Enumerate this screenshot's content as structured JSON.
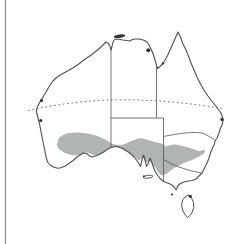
{
  "figure": {
    "type": "species-distribution-map",
    "region": "Australia",
    "features": {
      "mainland": "Australia mainland coastline with state borders",
      "shading": "grey distribution range across southern Australia",
      "dotted_line": "Tropic of Capricorn",
      "islands": [
        "Melville Island",
        "Groote Eylandt",
        "Mornington Island",
        "Fraser Island dot",
        "Shark Bay dot",
        "west-coast dot",
        "Kangaroo Island",
        "Bass Strait islet",
        "Tasmania"
      ]
    }
  },
  "colors": {
    "background": "#ffffff",
    "coastline": "#4f4f4f",
    "state_border": "#555555",
    "range_fill": "#b0b4b3",
    "tropic_line": "#7d7d7d",
    "island_fill": "#333333",
    "page_edge_line": "#8f8f8f"
  }
}
